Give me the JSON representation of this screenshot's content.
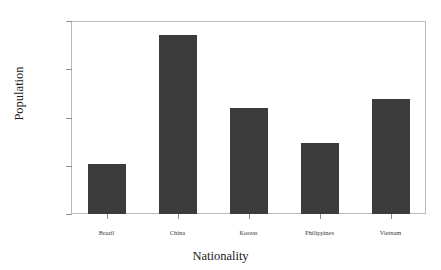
{
  "chart_data": {
    "type": "bar",
    "title": "",
    "xlabel": "Nationality",
    "ylabel": "Population",
    "categories": [
      "Brazil",
      "China",
      "Koreas",
      "Philippines",
      "Vietnam"
    ],
    "values": [
      207000,
      742000,
      439000,
      294000,
      477000
    ],
    "ylim": [
      0,
      800000
    ],
    "ytick_values": [
      0,
      200000,
      400000,
      600000,
      800000
    ],
    "ytick_labels": [
      "0",
      "200,000",
      "400,000",
      "600,000",
      "800,000"
    ],
    "grid": false,
    "legend": false,
    "bar_color": "#3b3b3b",
    "frame_color": "#b9b9b9",
    "background_color": "#ffffff"
  }
}
